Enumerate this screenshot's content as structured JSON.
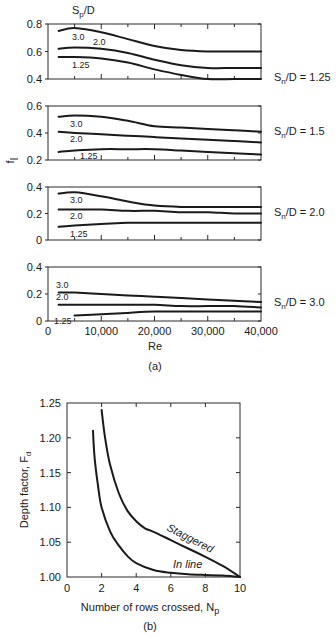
{
  "figure_a": {
    "caption": "(a)",
    "header_label": "Sp/D",
    "ylabel": "f̄",
    "xlabel": "Re",
    "x_ticks": [
      "0",
      "10,000",
      "20,000",
      "30,000",
      "40,000"
    ]
  },
  "figure_b": {
    "caption": "(b)",
    "ylabel": "Depth factor, Fd",
    "xlabel": "Number of rows crossed, Np",
    "x_ticks": [
      "0",
      "2",
      "4",
      "6",
      "8",
      "10"
    ],
    "y_ticks": [
      "1.25",
      "1.20",
      "1.15",
      "1.10",
      "1.05",
      "1.00"
    ],
    "staggered_label": "Staggered",
    "inline_label": "In line"
  },
  "chart_data": [
    {
      "type": "line",
      "title": "Friction factor vs Re, Sn/D = 1.25",
      "panel_label": "Sn/D = 1.25",
      "xlabel": "Re",
      "ylabel": "f̄",
      "xlim": [
        0,
        40000
      ],
      "ylim": [
        0.4,
        0.8
      ],
      "y_ticks": [
        "0.8",
        "0.6",
        "0.4"
      ],
      "x": [
        2000,
        5000,
        10000,
        15000,
        20000,
        25000,
        30000,
        35000,
        40000
      ],
      "series": [
        {
          "name": "3.0",
          "values": [
            0.75,
            0.77,
            0.74,
            0.69,
            0.64,
            0.61,
            0.6,
            0.6,
            0.6
          ]
        },
        {
          "name": "2.0",
          "values": [
            0.62,
            0.63,
            0.62,
            0.59,
            0.54,
            0.5,
            0.48,
            0.48,
            0.48
          ]
        },
        {
          "name": "1.25",
          "values": [
            0.56,
            0.56,
            0.55,
            0.52,
            0.47,
            0.43,
            0.4,
            0.4,
            0.4
          ]
        }
      ],
      "grid": false,
      "legend": "inline labels, header Sp/D"
    },
    {
      "type": "line",
      "title": "Friction factor vs Re, Sn/D = 1.5",
      "panel_label": "Sn/D = 1.5",
      "xlabel": "Re",
      "ylabel": "f̄",
      "xlim": [
        0,
        40000
      ],
      "ylim": [
        0.2,
        0.6
      ],
      "y_ticks": [
        "0.6",
        "0.4",
        "0.2"
      ],
      "x": [
        2000,
        5000,
        10000,
        15000,
        20000,
        25000,
        30000,
        35000,
        40000
      ],
      "series": [
        {
          "name": "3.0",
          "values": [
            0.52,
            0.53,
            0.52,
            0.49,
            0.45,
            0.44,
            0.43,
            0.42,
            0.41
          ]
        },
        {
          "name": "2.0",
          "values": [
            0.41,
            0.4,
            0.39,
            0.38,
            0.37,
            0.36,
            0.35,
            0.34,
            0.33
          ]
        },
        {
          "name": "1.25",
          "values": [
            0.26,
            0.27,
            0.28,
            0.28,
            0.28,
            0.27,
            0.26,
            0.25,
            0.24
          ]
        }
      ],
      "grid": false
    },
    {
      "type": "line",
      "title": "Friction factor vs Re, Sn/D = 2.0",
      "panel_label": "Sn/D = 2.0",
      "xlabel": "Re",
      "ylabel": "f̄",
      "xlim": [
        0,
        40000
      ],
      "ylim": [
        0,
        0.4
      ],
      "y_ticks": [
        "0.4",
        "0.2",
        "0"
      ],
      "x": [
        2000,
        5000,
        10000,
        15000,
        20000,
        25000,
        30000,
        35000,
        40000
      ],
      "series": [
        {
          "name": "3.0",
          "values": [
            0.35,
            0.36,
            0.33,
            0.29,
            0.26,
            0.25,
            0.25,
            0.25,
            0.25
          ]
        },
        {
          "name": "2.0",
          "values": [
            0.23,
            0.23,
            0.23,
            0.22,
            0.22,
            0.21,
            0.21,
            0.2,
            0.2
          ]
        },
        {
          "name": "1.25",
          "values": [
            0.1,
            0.11,
            0.12,
            0.13,
            0.13,
            0.13,
            0.13,
            0.13,
            0.13
          ]
        }
      ],
      "grid": false
    },
    {
      "type": "line",
      "title": "Friction factor vs Re, Sn/D = 3.0",
      "panel_label": "Sn/D = 3.0",
      "xlabel": "Re",
      "ylabel": "f̄",
      "xlim": [
        0,
        40000
      ],
      "ylim": [
        0,
        0.4
      ],
      "y_ticks": [
        "0.4",
        "0.2",
        "0"
      ],
      "x_ticks": [
        "0",
        "10,000",
        "20,000",
        "30,000",
        "40,000"
      ],
      "x": [
        2000,
        5000,
        10000,
        15000,
        20000,
        25000,
        30000,
        35000,
        40000
      ],
      "series": [
        {
          "name": "3.0",
          "values": [
            0.21,
            0.21,
            0.2,
            0.19,
            0.18,
            0.17,
            0.16,
            0.15,
            0.14
          ]
        },
        {
          "name": "2.0",
          "values": [
            0.12,
            0.12,
            0.12,
            0.12,
            0.12,
            0.11,
            0.11,
            0.11,
            0.1
          ]
        },
        {
          "name": "1.25",
          "values": [
            null,
            0.04,
            0.05,
            0.06,
            0.07,
            0.07,
            0.07,
            0.07,
            0.07
          ]
        }
      ],
      "grid": false
    },
    {
      "type": "line",
      "title": "Depth factor vs number of rows crossed",
      "xlabel": "Number of rows crossed, Np",
      "ylabel": "Depth factor, Fd",
      "xlim": [
        0,
        10
      ],
      "ylim": [
        1.0,
        1.25
      ],
      "x_ticks": [
        "0",
        "2",
        "4",
        "6",
        "8",
        "10"
      ],
      "y_ticks": [
        "1.00",
        "1.05",
        "1.10",
        "1.15",
        "1.20",
        "1.25"
      ],
      "series": [
        {
          "name": "Staggered",
          "x": [
            2.0,
            2.2,
            2.5,
            3.0,
            3.5,
            4.0,
            4.5,
            5.0,
            6.0,
            7.0,
            8.0,
            9.0,
            10.0
          ],
          "values": [
            1.24,
            1.2,
            1.16,
            1.12,
            1.095,
            1.08,
            1.07,
            1.065,
            1.053,
            1.041,
            1.029,
            1.016,
            1.0
          ]
        },
        {
          "name": "In line",
          "x": [
            1.5,
            1.6,
            1.8,
            2.0,
            2.5,
            3.0,
            3.5,
            4.0,
            5.0,
            6.0,
            7.0,
            8.0,
            9.0,
            10.0
          ],
          "values": [
            1.21,
            1.17,
            1.13,
            1.1,
            1.065,
            1.045,
            1.03,
            1.02,
            1.01,
            1.006,
            1.004,
            1.003,
            1.002,
            1.0
          ]
        }
      ],
      "grid": false,
      "legend": "inline labels"
    }
  ]
}
